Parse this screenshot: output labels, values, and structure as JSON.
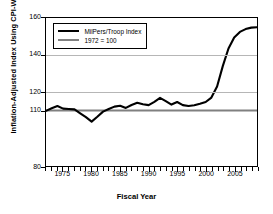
{
  "chart_data": {
    "type": "line",
    "title": "",
    "xlabel": "Fiscal Year",
    "ylabel": "Inflation-Adjusted Index Using CPI-W",
    "xlim": [
      1972,
      2009
    ],
    "ylim": [
      80,
      160
    ],
    "grid": true,
    "gridlines_y": [
      120,
      140
    ],
    "y_ticks": [
      80,
      110,
      120,
      140,
      160
    ],
    "y_tick_labels": [
      "80",
      "110",
      "120",
      "140",
      "160"
    ],
    "x_ticks": [
      1975,
      1980,
      1985,
      1990,
      1995,
      2000,
      2005
    ],
    "x_tick_labels": [
      "1975",
      "1980",
      "1985",
      "1990",
      "1995",
      "2000",
      "2005"
    ],
    "x_minor_tick_interval": 1,
    "legend_position": "upper-left-inside",
    "series": [
      {
        "name": "MilPers/Troop Index",
        "color": "#000000",
        "linewidth": 2.1,
        "x": [
          1972,
          1973,
          1974,
          1975,
          1976,
          1977,
          1978,
          1979,
          1980,
          1981,
          1982,
          1983,
          1984,
          1985,
          1986,
          1987,
          1988,
          1989,
          1990,
          1991,
          1992,
          1993,
          1994,
          1995,
          1996,
          1997,
          1998,
          1999,
          2000,
          2001,
          2002,
          2003,
          2004,
          2005,
          2006,
          2007,
          2008,
          2009
        ],
        "values": [
          109.8,
          111.2,
          112.4,
          111.0,
          110.8,
          110.6,
          108.5,
          106.4,
          104.0,
          106.6,
          109.4,
          110.8,
          112.1,
          112.6,
          111.4,
          113.0,
          114.2,
          113.4,
          112.9,
          114.7,
          116.8,
          115.1,
          113.2,
          114.6,
          112.9,
          112.4,
          112.8,
          113.6,
          114.6,
          117.0,
          123.0,
          134.0,
          143.5,
          149.5,
          152.5,
          154.0,
          154.8,
          155.0
        ]
      },
      {
        "name": "1972 = 100",
        "color": "#808080",
        "linewidth": 2.1,
        "constant_value": 110,
        "x": [
          1972,
          2009
        ],
        "values": [
          110,
          110
        ]
      }
    ]
  },
  "legend": {
    "entries": [
      {
        "label": "MilPers/Troop Index",
        "color": "#000000"
      },
      {
        "label": "1972 = 100",
        "color": "#808080"
      }
    ]
  },
  "axes": {
    "x_title": "Fiscal Year",
    "y_title": "Inflation-Adjusted Index Using CPI-W"
  }
}
